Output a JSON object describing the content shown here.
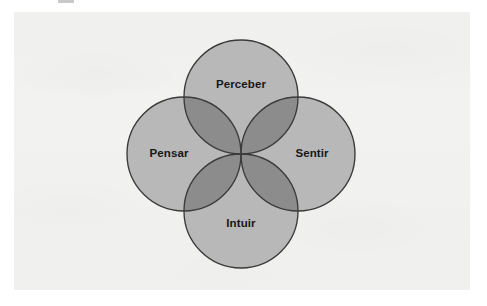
{
  "figure": {
    "title": "",
    "type": "four-circle-venn",
    "colors": {
      "page_background": "#ffffff",
      "panel_background": "#f2f2f0",
      "circle_fill": "#b8b8b8",
      "overlap_fill": "#8c8c8c",
      "circle_stroke": "#3a3a3a",
      "label_text": "#171717"
    },
    "geometry": {
      "common_center_x": 227,
      "common_center_y": 142,
      "radius": 57,
      "offset": 57
    },
    "circles": [
      {
        "id": "perceber",
        "label": "Perceber",
        "position": "top",
        "cx": 227,
        "cy": 85,
        "label_x": 227,
        "label_y": 73
      },
      {
        "id": "sentir",
        "label": "Sentir",
        "position": "right",
        "cx": 284,
        "cy": 142,
        "label_x": 298,
        "label_y": 142
      },
      {
        "id": "intuir",
        "label": "Intuir",
        "position": "bottom",
        "cx": 227,
        "cy": 199,
        "label_x": 227,
        "label_y": 212
      },
      {
        "id": "pensar",
        "label": "Pensar",
        "position": "left",
        "cx": 170,
        "cy": 142,
        "label_x": 155,
        "label_y": 142
      }
    ]
  },
  "artifacts": {
    "top_text_fragment": ""
  }
}
